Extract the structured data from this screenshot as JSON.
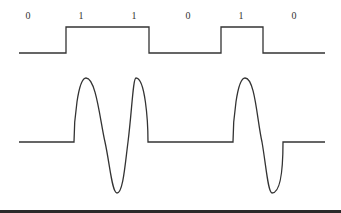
{
  "diagram": {
    "title": "",
    "bits": [
      "0",
      "1",
      "1",
      "0",
      "1",
      "0"
    ],
    "bit_label_x": [
      28,
      81,
      134,
      188,
      241,
      294
    ],
    "signals": [
      {
        "name": "digital-signal",
        "type": "square-wave"
      },
      {
        "name": "modulated-signal",
        "type": "PSK-style sinusoid bursts for 1 bits"
      }
    ],
    "colors": {
      "line": "#333333",
      "background": "#ffffff",
      "bottom_rule": "#2a2a2a"
    }
  }
}
